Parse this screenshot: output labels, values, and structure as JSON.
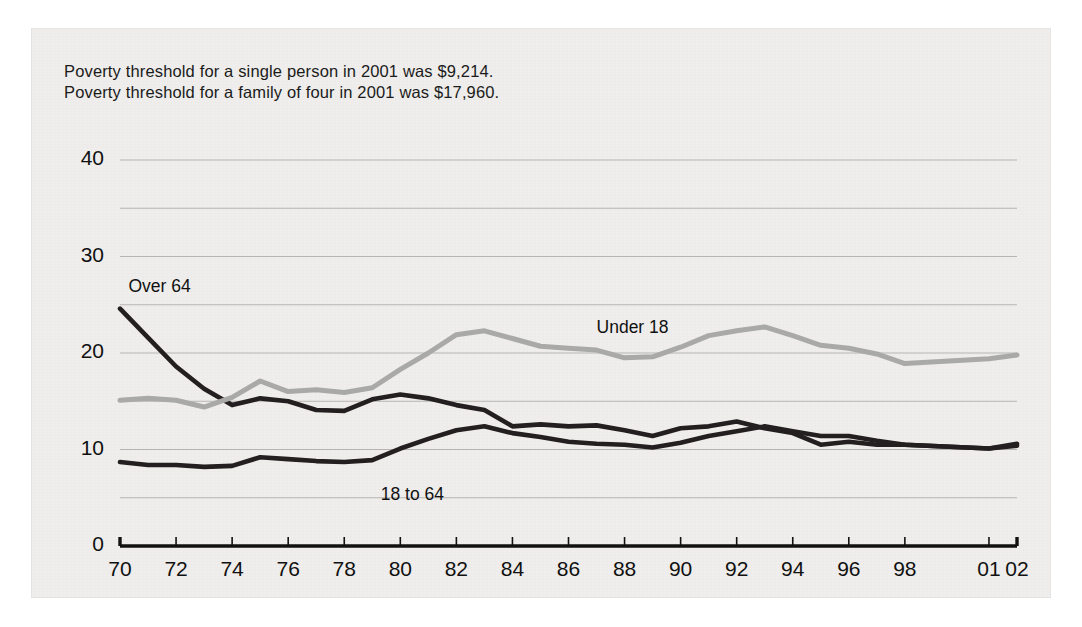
{
  "notes": {
    "line1": "Poverty threshold for a single person in 2001 was $9,214.",
    "line2": "Poverty threshold for a family of four in 2001 was $17,960."
  },
  "chart_data": {
    "type": "line",
    "title": "",
    "xlabel": "",
    "ylabel": "",
    "xlim": [
      1970,
      2002
    ],
    "ylim": [
      0,
      40
    ],
    "grid": true,
    "grid_interval": 5,
    "ytick_labels": [
      "0",
      "10",
      "20",
      "30",
      "40"
    ],
    "ytick_values": [
      0,
      10,
      20,
      30,
      40
    ],
    "xtick_labels": [
      "70",
      "72",
      "74",
      "76",
      "78",
      "80",
      "82",
      "84",
      "86",
      "88",
      "90",
      "92",
      "94",
      "96",
      "98",
      "01",
      "02"
    ],
    "xtick_values": [
      1970,
      1972,
      1974,
      1976,
      1978,
      1980,
      1982,
      1984,
      1986,
      1988,
      1990,
      1992,
      1994,
      1996,
      1998,
      2001,
      2002
    ],
    "legend_position": "inline-annotations",
    "annotations": [
      {
        "text": "Over 64",
        "x": 1970.3,
        "y": 26.8
      },
      {
        "text": "Under 18",
        "x": 1987.0,
        "y": 22.6
      },
      {
        "text": "18 to 64",
        "x": 1979.3,
        "y": 5.3
      }
    ],
    "x": [
      1970,
      1971,
      1972,
      1973,
      1974,
      1975,
      1976,
      1977,
      1978,
      1979,
      1980,
      1981,
      1982,
      1983,
      1984,
      1985,
      1986,
      1987,
      1988,
      1989,
      1990,
      1991,
      1992,
      1993,
      1994,
      1995,
      1996,
      1997,
      1998,
      2001,
      2002
    ],
    "series": [
      {
        "name": "Over 64",
        "color": "#231f20",
        "width": 4.6,
        "values": [
          24.6,
          21.6,
          18.6,
          16.3,
          14.6,
          15.3,
          15.0,
          14.1,
          14.0,
          15.2,
          15.7,
          15.3,
          14.6,
          14.1,
          12.4,
          12.6,
          12.4,
          12.5,
          12.0,
          11.4,
          12.2,
          12.4,
          12.9,
          12.2,
          11.7,
          10.5,
          10.8,
          10.5,
          10.5,
          10.1,
          10.4
        ]
      },
      {
        "name": "Under 18",
        "color": "#a9a9a7",
        "width": 5.0,
        "values": [
          15.1,
          15.3,
          15.1,
          14.4,
          15.4,
          17.1,
          16.0,
          16.2,
          15.9,
          16.4,
          18.3,
          20.0,
          21.9,
          22.3,
          21.5,
          20.7,
          20.5,
          20.3,
          19.5,
          19.6,
          20.6,
          21.8,
          22.3,
          22.7,
          21.8,
          20.8,
          20.5,
          19.9,
          18.9,
          19.4,
          19.8
        ]
      },
      {
        "name": "18 to 64",
        "color": "#231f20",
        "width": 4.6,
        "values": [
          8.7,
          8.4,
          8.4,
          8.2,
          8.3,
          9.2,
          9.0,
          8.8,
          8.7,
          8.9,
          10.1,
          11.1,
          12.0,
          12.4,
          11.7,
          11.3,
          10.8,
          10.6,
          10.5,
          10.2,
          10.7,
          11.4,
          11.9,
          12.4,
          11.9,
          11.4,
          11.4,
          10.9,
          10.5,
          10.1,
          10.6
        ]
      }
    ]
  }
}
